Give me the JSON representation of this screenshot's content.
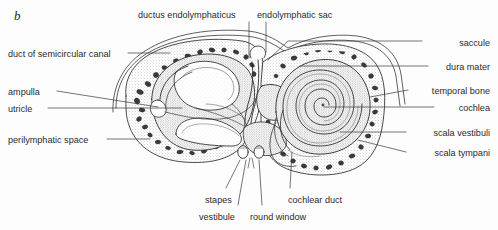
{
  "figure": {
    "panel_letter": "b",
    "ink_color": "#2b2b2b",
    "background_color": "#fdfdfd",
    "bone_fill": "#ffffff",
    "stipple_color": "#8a8a8a"
  },
  "labels": {
    "top": [
      {
        "text": "ductus endolymphaticus",
        "x": 138,
        "y": 11
      },
      {
        "text": "endolymphatic sac",
        "x": 257,
        "y": 11
      }
    ],
    "left": [
      {
        "text": "duct of semicircular canal",
        "x": 8,
        "y": 50
      },
      {
        "text": "ampulla",
        "x": 8,
        "y": 88
      },
      {
        "text": "utricle",
        "x": 8,
        "y": 105
      },
      {
        "text": "perilymphatic space",
        "x": 8,
        "y": 136
      }
    ],
    "right": [
      {
        "text": "saccule",
        "x": 490,
        "y": 39
      },
      {
        "text": "dura mater",
        "x": 490,
        "y": 63
      },
      {
        "text": "temporal bone",
        "x": 490,
        "y": 87
      },
      {
        "text": "cochlea",
        "x": 490,
        "y": 104
      },
      {
        "text": "scala vestibuli",
        "x": 490,
        "y": 129
      },
      {
        "text": "scala tympani",
        "x": 490,
        "y": 149
      }
    ],
    "bottom": [
      {
        "text": "stapes",
        "x": 205,
        "y": 196
      },
      {
        "text": "cochlear duct",
        "x": 288,
        "y": 196
      },
      {
        "text": "vestibule",
        "x": 199,
        "y": 213
      },
      {
        "text": "round window",
        "x": 250,
        "y": 213
      }
    ]
  }
}
